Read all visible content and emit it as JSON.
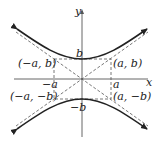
{
  "diagram": {
    "axes": {
      "x_label": "x",
      "y_label": "y"
    },
    "vertex_labels": {
      "top": "b",
      "bottom": "−b"
    },
    "axis_tick_labels": {
      "neg_a": "−a",
      "pos_a": "a"
    },
    "corner_labels": {
      "top_left": "(−a, b)",
      "top_right": "(a, b)",
      "bottom_left": "(−a, −b)",
      "bottom_right": "(a, −b)"
    },
    "colors": {
      "curve": "#222222",
      "axis": "#555555",
      "dashed": "#555555"
    }
  }
}
